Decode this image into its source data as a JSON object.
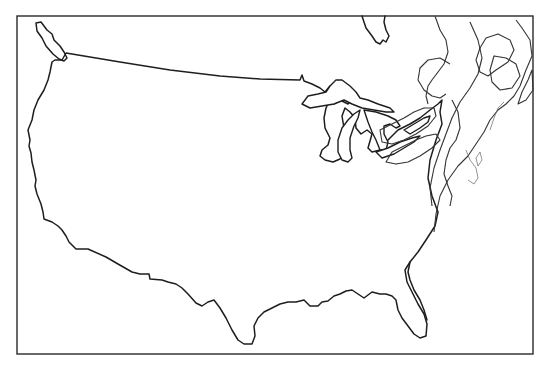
{
  "map": {
    "title": "",
    "subject": "Outline map of the contiguous United States with Great Lakes and northeastern physiographic contour lines",
    "frame": {
      "x": 17,
      "y": 16,
      "width": 516,
      "height": 338
    },
    "colors": {
      "background": "#ffffff",
      "outline": "#1e1e1e",
      "contour": "#333333",
      "frame": "#2a2a2a"
    },
    "features": [
      {
        "id": "us-outline",
        "label": "Contiguous United States"
      },
      {
        "id": "vancouver-island",
        "label": "Vancouver Island"
      },
      {
        "id": "hudson-james-bay",
        "label": "James Bay"
      },
      {
        "id": "lake-superior",
        "label": "Lake Superior"
      },
      {
        "id": "lake-michigan",
        "label": "Lake Michigan"
      },
      {
        "id": "lake-huron",
        "label": "Lake Huron"
      },
      {
        "id": "lake-erie",
        "label": "Lake Erie"
      },
      {
        "id": "lake-ontario",
        "label": "Lake Ontario"
      },
      {
        "id": "appalachian-contours",
        "label": "Northeastern contour lines (hachured)"
      },
      {
        "id": "florida",
        "label": "Florida peninsula"
      }
    ]
  }
}
